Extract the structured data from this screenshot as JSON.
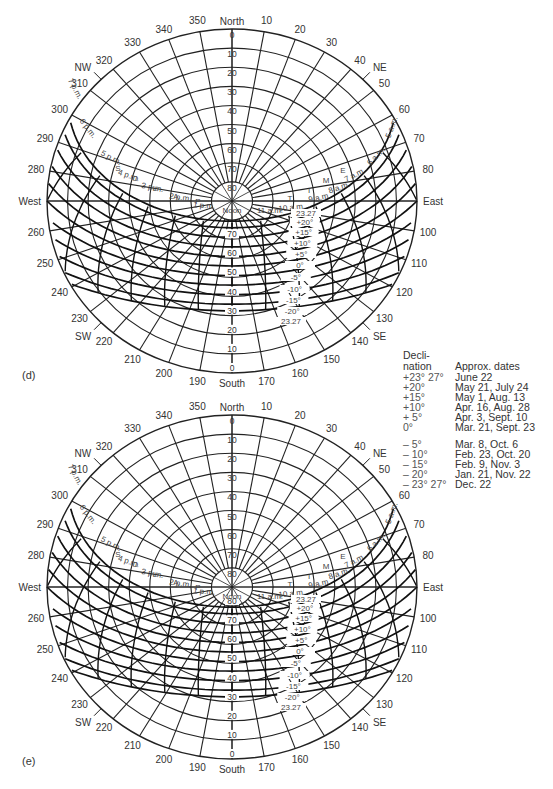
{
  "chart_data": [
    {
      "type": "diagram",
      "title": "Sun path diagram",
      "panel_label": "(d)",
      "compass": {
        "north": "North",
        "south": "South",
        "east": "East",
        "west": "West",
        "ne": "NE",
        "nw": "NW",
        "se": "SE",
        "sw": "SW"
      },
      "azimuth_labels": [
        "350",
        "340",
        "330",
        "320",
        "310",
        "300",
        "290",
        "280",
        "260",
        "250",
        "240",
        "230",
        "220",
        "210",
        "200",
        "190",
        "170",
        "160",
        "150",
        "140",
        "130",
        "120",
        "110",
        "100",
        "80",
        "70",
        "60",
        "50",
        "40",
        "30",
        "20",
        "10"
      ],
      "altitude_labels": [
        "0",
        "10",
        "20",
        "30",
        "40",
        "50",
        "60",
        "70",
        "80"
      ],
      "lower_altitude_labels": [
        "70",
        "60",
        "50",
        "40",
        "30",
        "20",
        "10",
        "0"
      ],
      "hour_labels_pm": [
        "7 p.m.",
        "6 p.m.",
        "5 p.m.",
        "4 p.m.",
        "3 p.m.",
        "2 p.m.",
        "1 p.m.",
        "Noon"
      ],
      "hour_labels_am": [
        "11 a.m.",
        "10 a.m.",
        "9 a.m.",
        "8 a.m.",
        "7 a.m.",
        "6 a.m.",
        "5 a.m."
      ],
      "month_letters_left": [
        "S",
        "O",
        "L",
        "A",
        "P"
      ],
      "month_letters_right": [
        "T",
        "I",
        "M",
        "E"
      ],
      "declination_labels": [
        "23.27",
        "+20°",
        "+15°",
        "+10°",
        "+5°",
        "0°",
        "-5°",
        "-10°",
        "-15°",
        "-20°",
        "23.27"
      ]
    },
    {
      "type": "diagram",
      "title": "Sun path diagram",
      "panel_label": "(e)",
      "compass": {
        "north": "North",
        "south": "South",
        "east": "East",
        "west": "West",
        "ne": "NE",
        "nw": "NW",
        "se": "SE",
        "sw": "SW"
      },
      "azimuth_labels": [
        "350",
        "340",
        "330",
        "320",
        "310",
        "300",
        "290",
        "280",
        "260",
        "250",
        "240",
        "230",
        "220",
        "210",
        "200",
        "190",
        "170",
        "160",
        "150",
        "140",
        "130",
        "120",
        "110",
        "100",
        "80",
        "70",
        "60",
        "50",
        "40",
        "30",
        "20",
        "10"
      ],
      "altitude_labels": [
        "0",
        "10",
        "20",
        "30",
        "40",
        "50",
        "60",
        "70",
        "80"
      ],
      "lower_altitude_labels": [
        "80",
        "70",
        "60",
        "50",
        "40",
        "30",
        "20",
        "10",
        "0"
      ],
      "hour_labels_pm": [
        "7 p.m.",
        "6 p.m.",
        "5 p.m.",
        "4 p.m.",
        "3 p.m.",
        "2 p.m.",
        "1 p.m.",
        "Noon"
      ],
      "hour_labels_am": [
        "11 a.m.",
        "10 a.m.",
        "9 a.m.",
        "8 a.m.",
        "7 a.m.",
        "6 a.m.",
        "5 a.m."
      ],
      "month_letters_left": [
        "S",
        "O",
        "L",
        "A",
        "P"
      ],
      "month_letters_right": [
        "T",
        "I",
        "M",
        "E"
      ],
      "declination_labels": [
        "23.27",
        "+20°",
        "+15°",
        "+10°",
        "+5°",
        "0°",
        "-5°",
        "-10°",
        "-15°",
        "-20°",
        "23.27"
      ]
    }
  ],
  "legend": {
    "col1_header_line1": "Decli-",
    "col1_header_line2": "nation",
    "col2_header": "Approx. dates",
    "rows_upper": [
      {
        "declination": "+23° 27°",
        "dates": "June 22"
      },
      {
        "declination": "+20°",
        "dates": "May 21, July 24"
      },
      {
        "declination": "+15°",
        "dates": "May 1, Aug. 13"
      },
      {
        "declination": "+10°",
        "dates": "Apr. 16, Aug. 28"
      },
      {
        "declination": "+  5°",
        "dates": "Apr. 3, Sept. 10"
      },
      {
        "declination": "0°",
        "dates": "Mar. 21, Sept. 23"
      }
    ],
    "rows_lower": [
      {
        "declination": "–  5°",
        "dates": "Mar. 8, Oct. 6"
      },
      {
        "declination": "– 10°",
        "dates": "Feb. 23, Oct. 20"
      },
      {
        "declination": "– 15°",
        "dates": "Feb. 9, Nov. 3"
      },
      {
        "declination": "– 20°",
        "dates": "Jan. 21, Nov. 22"
      },
      {
        "declination": "– 23° 27°",
        "dates": "Dec. 22"
      }
    ]
  }
}
